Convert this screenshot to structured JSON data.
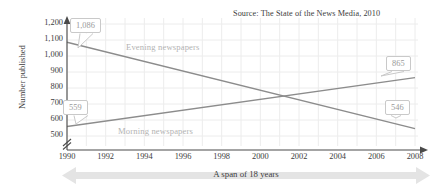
{
  "chart_data": {
    "type": "line",
    "title": "",
    "source_note": "Source: The State of the News Media, 2010",
    "xlabel": "A span of 18 years",
    "ylabel": "Number published",
    "x": [
      1990,
      1992,
      1994,
      1996,
      1998,
      2000,
      2002,
      2004,
      2006,
      2008
    ],
    "xtick_labels": [
      "1990",
      "1992",
      "1994",
      "1996",
      "1998",
      "2000",
      "2002",
      "2004",
      "2006",
      "2008"
    ],
    "xlim": [
      1990,
      2008
    ],
    "ylim": [
      500,
      1200
    ],
    "ytick_labels": [
      "1,200",
      "1,100",
      "1,000",
      "900",
      "800",
      "700",
      "600",
      "500"
    ],
    "ytick_values": [
      1200,
      1100,
      1000,
      900,
      800,
      700,
      600,
      500
    ],
    "y_axis_break": true,
    "grid": true,
    "legend": "inline-labels",
    "series": [
      {
        "name": "Evening newspapers",
        "color": "#8c8c8c",
        "endpoints": [
          {
            "x": 1990,
            "y": 1086,
            "label": "1,086"
          },
          {
            "x": 2008,
            "y": 546,
            "label": "546"
          }
        ],
        "values": [
          1086,
          1026,
          966,
          906,
          846,
          786,
          726,
          666,
          606,
          546
        ]
      },
      {
        "name": "Morning newspapers",
        "color": "#8c8c8c",
        "endpoints": [
          {
            "x": 1990,
            "y": 559,
            "label": "559"
          },
          {
            "x": 2008,
            "y": 865,
            "label": "865"
          }
        ],
        "values": [
          559,
          593,
          627,
          661,
          695,
          729,
          763,
          797,
          831,
          865
        ]
      }
    ],
    "annotations": [
      {
        "name": "callout-1086",
        "text": "1,086",
        "series": "Evening newspapers",
        "x": 1990,
        "y": 1086
      },
      {
        "name": "callout-546",
        "text": "546",
        "series": "Evening newspapers",
        "x": 2008,
        "y": 546
      },
      {
        "name": "callout-559",
        "text": "559",
        "series": "Morning newspapers",
        "x": 1990,
        "y": 559
      },
      {
        "name": "callout-865",
        "text": "865",
        "series": "Morning newspapers",
        "x": 2008,
        "y": 865
      }
    ],
    "colors": {
      "line": "#8c8c8c",
      "grid": "#ececec",
      "axis": "#4a4a4a",
      "callout_border": "#c9c9c9",
      "callout_text": "#9a9a9a",
      "series_label": "#b3b3b3",
      "banner": "#e4e4e4"
    }
  }
}
